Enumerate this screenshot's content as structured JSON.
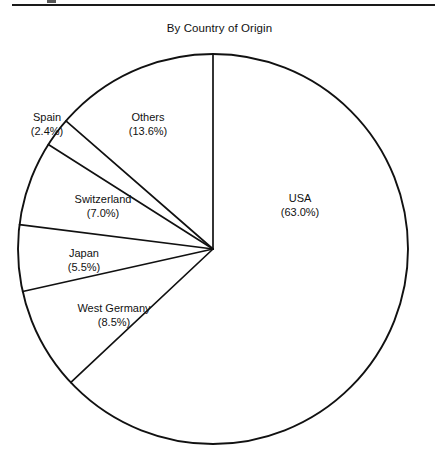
{
  "figure": {
    "name": "pie-chart-figure",
    "top_rule": true,
    "crop_artifact": true
  },
  "chart_data": {
    "type": "pie",
    "title": "By Country of Origin",
    "subtitle": "",
    "xlabel": "",
    "ylabel": "",
    "legend_position": "none",
    "grid": false,
    "units": "percent",
    "total": 100.0,
    "start_angle_deg": 0,
    "direction": "clockwise",
    "center": {
      "x": 213,
      "y": 249
    },
    "radius": 195,
    "categories": [
      "USA",
      "West Germany",
      "Japan",
      "Switzerland",
      "Spain",
      "Others"
    ],
    "values": [
      63.0,
      8.5,
      5.5,
      7.0,
      2.4,
      13.6
    ],
    "slices": [
      {
        "name": "USA",
        "value": 63.0,
        "value_label": "(63.0%)",
        "label_x": 300,
        "label_y": 205
      },
      {
        "name": "West Germany",
        "value": 8.5,
        "value_label": "(8.5%)",
        "label_x": 114,
        "label_y": 315
      },
      {
        "name": "Japan",
        "value": 5.5,
        "value_label": "(5.5%)",
        "label_x": 84,
        "label_y": 260
      },
      {
        "name": "Switzerland",
        "value": 7.0,
        "value_label": "(7.0%)",
        "label_x": 103,
        "label_y": 206
      },
      {
        "name": "Spain",
        "value": 2.4,
        "value_label": "(2.4%)",
        "label_x": 47,
        "label_y": 124
      },
      {
        "name": "Others",
        "value": 13.6,
        "value_label": "(13.6%)",
        "label_x": 148,
        "label_y": 124
      }
    ]
  }
}
